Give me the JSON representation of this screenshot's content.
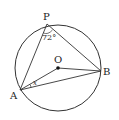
{
  "diagram": {
    "type": "circle-geometry",
    "circle": {
      "center_label": "O"
    },
    "points": {
      "P": {
        "label": "P"
      },
      "A": {
        "label": "A"
      },
      "B": {
        "label": "B"
      },
      "O": {
        "label": "O"
      }
    },
    "angles": {
      "P": {
        "label": "72°"
      },
      "A": {
        "label": "x"
      }
    },
    "segments": [
      "PA",
      "PB",
      "AB",
      "OA",
      "OB"
    ]
  },
  "colors": {
    "stroke": "#333333",
    "background": "#ffffff"
  }
}
